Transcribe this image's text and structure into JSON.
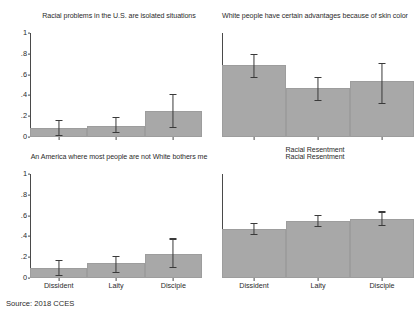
{
  "figure": {
    "source_note": "Source: 2018 CCES",
    "bar_color": "#a8a8a8",
    "error_color": "#3a3a3a",
    "axis_color": "#4a4a4a",
    "background": "#ffffff"
  },
  "chart_data": [
    {
      "type": "bar",
      "title": "Racial problems in the U.S. are isolated situations",
      "panel": "top-left",
      "categories": [
        "Dissident",
        "Laity",
        "Disciple"
      ],
      "values": [
        0.09,
        0.11,
        0.25
      ],
      "errors_low": [
        0.02,
        0.05,
        0.1
      ],
      "errors_high": [
        0.16,
        0.19,
        0.41
      ],
      "xlabel": "",
      "ylabel": "",
      "ylim": [
        0,
        1
      ],
      "yticks": [
        0,
        0.2,
        0.4,
        0.6,
        0.8,
        1
      ],
      "ytick_labels": [
        "0",
        ".2",
        ".4",
        ".6",
        ".8",
        "1"
      ],
      "show_xtick_labels": false,
      "grid": false
    },
    {
      "type": "bar",
      "title": "White people have certain advantages because of skin color",
      "panel": "top-right",
      "categories": [
        "Dissident",
        "Laity",
        "Disciple"
      ],
      "values": [
        0.69,
        0.47,
        0.54
      ],
      "errors_low": [
        0.58,
        0.36,
        0.33
      ],
      "errors_high": [
        0.8,
        0.58,
        0.71
      ],
      "xlabel": "Racial Resentment",
      "ylabel": "",
      "ylim": [
        0,
        1
      ],
      "yticks": [
        0,
        0.2,
        0.4,
        0.6,
        0.8,
        1
      ],
      "ytick_labels": [
        "0",
        ".2",
        ".4",
        ".6",
        ".8",
        "1"
      ],
      "show_xtick_labels": false,
      "grid": false
    },
    {
      "type": "bar",
      "title": "An America where most people are not White bothers me",
      "panel": "bottom-left",
      "categories": [
        "Dissident",
        "Laity",
        "Disciple"
      ],
      "values": [
        0.1,
        0.14,
        0.23
      ],
      "errors_low": [
        0.03,
        0.06,
        0.11
      ],
      "errors_high": [
        0.17,
        0.21,
        0.38
      ],
      "xlabel": "",
      "ylabel": "",
      "ylim": [
        0,
        1
      ],
      "yticks": [
        0,
        0.2,
        0.4,
        0.6,
        0.8,
        1
      ],
      "ytick_labels": [
        "0",
        ".2",
        ".4",
        ".6",
        ".8",
        "1"
      ],
      "show_xtick_labels": true,
      "grid": false
    },
    {
      "type": "bar",
      "title": "Racial Resentment",
      "panel": "bottom-right",
      "categories": [
        "Dissident",
        "Laity",
        "Disciple"
      ],
      "values": [
        0.47,
        0.55,
        0.57
      ],
      "errors_low": [
        0.42,
        0.5,
        0.51
      ],
      "errors_high": [
        0.53,
        0.61,
        0.64
      ],
      "xlabel": "",
      "ylabel": "",
      "ylim": [
        0,
        1
      ],
      "yticks": [
        0,
        0.2,
        0.4,
        0.6,
        0.8,
        1
      ],
      "ytick_labels": [
        "0",
        ".2",
        ".4",
        ".6",
        ".8",
        "1"
      ],
      "show_xtick_labels": true,
      "grid": false
    }
  ]
}
